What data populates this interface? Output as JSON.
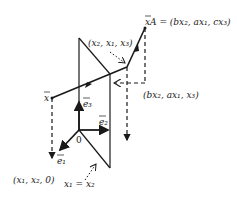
{
  "diagram": {
    "labels": {
      "x_vector": "x",
      "xA_label": "xA = (bx",
      "xA_full": "xA = (bx₂, ax₁, cx₃)",
      "reflected_point": "(x₂, x₁, x₃)",
      "projected_point": "(bx₂, ax₁, x₃)",
      "ground_point": "(x₁, x₂, 0)",
      "plane_equation": "x₁ = x₂",
      "origin": "0",
      "e1": "e₁",
      "e2": "e₂",
      "e3": "e₃"
    },
    "colors": {
      "stroke": "#1a1a1a",
      "background": "#ffffff"
    }
  }
}
